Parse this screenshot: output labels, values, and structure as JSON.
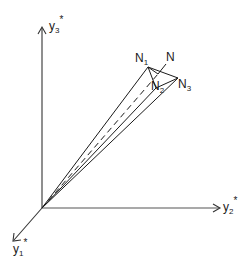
{
  "figure": {
    "type": "3d-axes-cone-diagram",
    "colors": {
      "ink": "#1a1a1a",
      "axis": "#444444",
      "background": "#ffffff"
    },
    "axes": [
      {
        "id": "y3",
        "base": "y",
        "sub": "3",
        "sup": "*",
        "direction": "up"
      },
      {
        "id": "y2",
        "base": "y",
        "sub": "2",
        "sup": "*",
        "direction": "right"
      },
      {
        "id": "y1",
        "base": "y",
        "sub": "1",
        "sup": "*",
        "direction": "down-left"
      }
    ],
    "points": [
      {
        "id": "N1",
        "base": "N",
        "sub": "1"
      },
      {
        "id": "N",
        "base": "N",
        "sub": ""
      },
      {
        "id": "N2",
        "base": "N",
        "sub": "2"
      },
      {
        "id": "N3",
        "base": "N",
        "sub": "3"
      }
    ],
    "dashed_line": "origin to N"
  }
}
